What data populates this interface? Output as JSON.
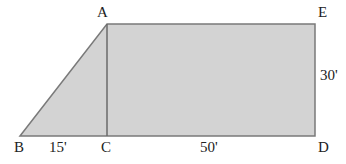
{
  "diagram": {
    "type": "trapezoid-composite",
    "fill_color": "#d3d3d3",
    "stroke_color": "#7a7a7a",
    "points": {
      "A": {
        "label": "A",
        "x": 107,
        "y": 24
      },
      "B": {
        "label": "B",
        "x": 20,
        "y": 136
      },
      "C": {
        "label": "C",
        "x": 107,
        "y": 136
      },
      "D": {
        "label": "D",
        "x": 315,
        "y": 136
      },
      "E": {
        "label": "E",
        "x": 315,
        "y": 24
      }
    },
    "dimensions": {
      "BC": "15'",
      "CD": "50'",
      "DE": "30'"
    }
  }
}
